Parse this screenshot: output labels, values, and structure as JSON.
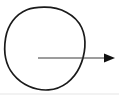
{
  "figure": {
    "canvas": {
      "width": 119,
      "height": 95,
      "background_color": "#ffffff"
    },
    "shapes": {
      "circle": {
        "name": "hand-drawn-oval-outline",
        "stroke_color": "#1a1a1a",
        "fill": "none",
        "stroke_width": 1.7,
        "center_x": 44.5,
        "center_y": 48.5,
        "radius_x": 39.5,
        "radius_y": 41.5,
        "path": "M 44.0 7.2 C 60.5 7.0 75.5 14.5 81.6 27.5 C 87.2 39.4 85.3 54.8 79.6 67.2 C 73.8 79.6 62.5 88.9 48.5 89.9 C 34.8 90.8 21.5 84.6 13.2 74.3 C 5.0 64.2 3.6 50.2 5.6 38.0 C 7.7 25.3 15.5 14.4 27.0 9.8 C 32.3 7.7 38.1 7.3 44.0 7.2 Z"
      },
      "arrow": {
        "name": "rightward-arrow",
        "stroke_color": "#3a3a3a",
        "stroke_width": 1.0,
        "head_fill_color": "#111111",
        "tail_x": 38,
        "tail_y": 58,
        "tip_x": 115,
        "tip_y": 58,
        "shaft_end_x": 104,
        "head_half_height": 4.5,
        "head_length": 11,
        "direction": "right"
      },
      "bottom_band": {
        "name": "bottom-edge-band",
        "color": "#f2f2f2",
        "height": 2
      }
    }
  }
}
